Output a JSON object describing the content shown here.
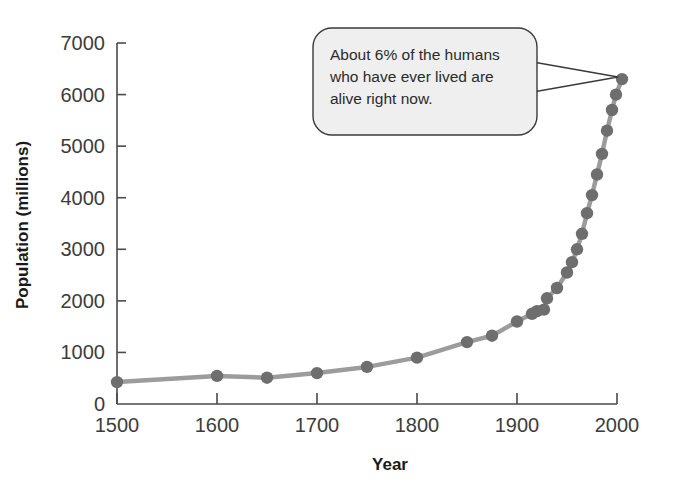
{
  "figure": {
    "background_color": "#ffffff",
    "axis_color": "#4a4a4a",
    "line_color": "#9c9c9c",
    "marker_color": "#6e6e6e",
    "callout_fill": "#eeeeee",
    "callout_border": "#3a3a3a",
    "text_color": "#3c3c3c"
  },
  "callout": {
    "name": "annotation-callout",
    "lines": [
      "About 6% of the humans",
      "who have ever lived are",
      "alive right now."
    ],
    "full_text": "About 6% of the humans who have ever lived are alive right now.",
    "points_to_year": 2005
  },
  "caption": {
    "text": ""
  },
  "chart_data": {
    "type": "line",
    "title": "",
    "subtitle": "",
    "xlabel": "Year",
    "ylabel": "Population (millions)",
    "xlim": [
      1500,
      2000
    ],
    "ylim": [
      0,
      7000
    ],
    "xticks": [
      1500,
      1600,
      1700,
      1800,
      1900,
      2000
    ],
    "xtick_labels": [
      "1500",
      "1600",
      "1700",
      "1800",
      "1900",
      "2000"
    ],
    "yticks": [
      0,
      1000,
      2000,
      3000,
      4000,
      5000,
      6000,
      7000
    ],
    "ytick_labels": [
      "0",
      "1000",
      "2000",
      "3000",
      "4000",
      "5000",
      "6000",
      "7000"
    ],
    "grid": false,
    "legend": false,
    "legend_position": "none",
    "marker": "circle",
    "series": [
      {
        "name": "World population",
        "x": [
          1500,
          1600,
          1650,
          1700,
          1750,
          1800,
          1850,
          1875,
          1900,
          1915,
          1920,
          1927,
          1930,
          1940,
          1950,
          1955,
          1960,
          1965,
          1970,
          1975,
          1980,
          1985,
          1990,
          1995,
          1999,
          2005
        ],
        "values": [
          425,
          545,
          510,
          600,
          720,
          900,
          1200,
          1325,
          1600,
          1750,
          1800,
          1830,
          2050,
          2250,
          2550,
          2750,
          3000,
          3300,
          3700,
          4050,
          4450,
          4850,
          5300,
          5700,
          6000,
          6300
        ]
      }
    ]
  }
}
